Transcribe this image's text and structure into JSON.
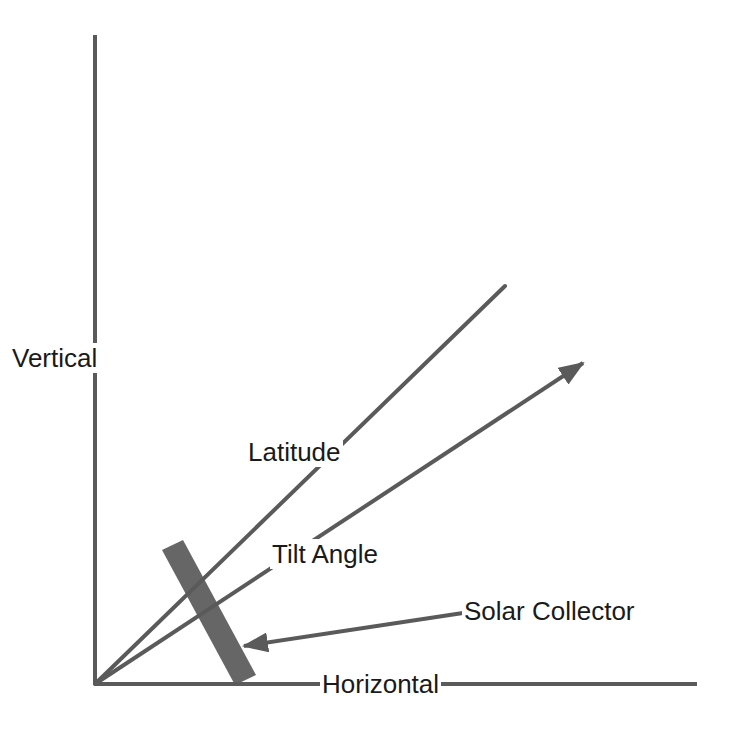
{
  "diagram": {
    "colors": {
      "line": "#5a5a5a",
      "collector": "#666666",
      "text": "#1a1a1a",
      "background": "#ffffff"
    },
    "labels": {
      "vertical": "Vertical",
      "horizontal": "Horizontal",
      "latitude": "Latitude",
      "tilt_angle": "Tilt Angle",
      "solar_collector": "Solar Collector"
    },
    "elements": [
      {
        "name": "vertical-axis",
        "type": "line",
        "from": [
          95,
          35
        ],
        "to": [
          95,
          684
        ]
      },
      {
        "name": "horizontal-axis",
        "type": "line",
        "from": [
          95,
          684
        ],
        "to": [
          697,
          684
        ]
      },
      {
        "name": "latitude-line",
        "type": "line",
        "from": [
          95,
          684
        ],
        "to": [
          505,
          286
        ]
      },
      {
        "name": "tilt-angle-arrow",
        "type": "arrow",
        "from": [
          95,
          684
        ],
        "to": [
          583,
          363
        ]
      },
      {
        "name": "solar-collector",
        "type": "rect",
        "corners": [
          [
            162,
            550
          ],
          [
            183,
            540
          ],
          [
            256,
            675
          ],
          [
            235,
            685
          ]
        ]
      },
      {
        "name": "collector-pointer-arrow",
        "type": "arrow",
        "from": [
          463,
          613
        ],
        "to": [
          244,
          646
        ]
      }
    ]
  }
}
